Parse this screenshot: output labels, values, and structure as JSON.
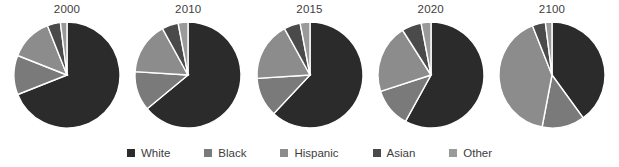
{
  "figure": {
    "kind": "pie-series",
    "background_color": "#ffffff",
    "label_color": "#3d3d3d"
  },
  "legend": {
    "position": "bottom-center",
    "items": [
      {
        "label": "White",
        "color": "#2b2b2b",
        "swatch_name": "legend-swatch-white"
      },
      {
        "label": "Black",
        "color": "#7a7a7a",
        "swatch_name": "legend-swatch-black"
      },
      {
        "label": "Hispanic",
        "color": "#8c8c8c",
        "swatch_name": "legend-swatch-hispanic"
      },
      {
        "label": "Asian",
        "color": "#4a4a4a",
        "swatch_name": "legend-swatch-asian"
      },
      {
        "label": "Other",
        "color": "#9a9a9a",
        "swatch_name": "legend-swatch-other"
      }
    ]
  },
  "chart_data": {
    "type": "pie",
    "title": "",
    "xlabel": "",
    "ylabel": "",
    "grid": false,
    "legend_position": "bottom",
    "legend_entries": [
      "White",
      "Black",
      "Hispanic",
      "Asian",
      "Other"
    ],
    "series_colors": [
      "#2b2b2b",
      "#7a7a7a",
      "#8c8c8c",
      "#4a4a4a",
      "#9a9a9a"
    ],
    "start_angle_deg": 0,
    "direction": "clockwise",
    "categories": [
      "White",
      "Black",
      "Hispanic",
      "Asian",
      "Other"
    ],
    "panels": [
      {
        "label": "2000",
        "values": [
          69,
          12,
          13,
          4,
          2
        ],
        "units": "percent"
      },
      {
        "label": "2010",
        "values": [
          64,
          12,
          16,
          5,
          3
        ],
        "units": "percent"
      },
      {
        "label": "2015",
        "values": [
          62,
          12,
          18,
          5,
          3
        ],
        "units": "percent"
      },
      {
        "label": "2020",
        "values": [
          58,
          12,
          21,
          6,
          3
        ],
        "units": "percent"
      },
      {
        "label": "2100",
        "values": [
          40,
          13,
          41,
          4,
          2
        ],
        "units": "percent"
      }
    ]
  }
}
